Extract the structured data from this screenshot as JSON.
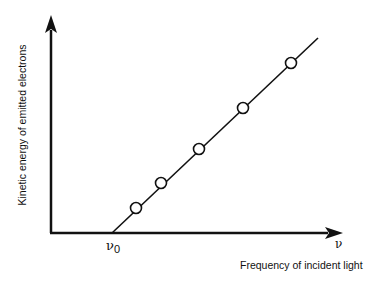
{
  "chart_data": {
    "type": "line",
    "title": "",
    "xlabel": "Frequency of incident light",
    "ylabel": "Kinetic energy of emitted electrons",
    "x_axis_symbol": "ν",
    "threshold_label": "ν",
    "threshold_subscript": "0",
    "grid": false,
    "legend": null,
    "series": [
      {
        "name": "measured points",
        "marker": "open-circle",
        "points_px": [
          [
            136,
            208
          ],
          [
            161,
            183
          ],
          [
            199,
            149
          ],
          [
            243,
            108
          ],
          [
            291,
            63
          ]
        ]
      },
      {
        "name": "fitted line",
        "line_px": [
          [
            112,
            233
          ],
          [
            318,
            38
          ]
        ]
      }
    ],
    "axes_px": {
      "origin": [
        51,
        233
      ],
      "x_end": [
        342,
        233
      ],
      "y_end": [
        51,
        16
      ]
    }
  }
}
